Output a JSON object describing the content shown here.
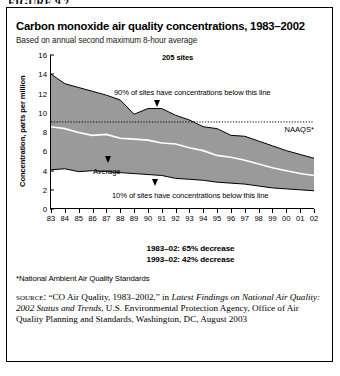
{
  "top_fragment": "FIGURE 9.2",
  "figure": {
    "title": "Carbon monoxide air quality concentrations, 1983–2002",
    "subtitle": "Based on annual second maximum 8-hour average",
    "sites_label": "205 sites",
    "naaqs_label": "NAAQS*",
    "upper_annotation": "90% of sites have concentrations below this line",
    "lower_annotation": "10% of sites have concentrations below this line",
    "average_annotation": "Average",
    "stats": [
      "1983–02: 65% decrease",
      "1993–02: 42% decrease"
    ],
    "footnote": "*National Ambient Air Quality Standards",
    "source_kicker": "source:",
    "source_text_1": "“CO Air Quality, 1983–2002,” in ",
    "source_italic_1": "Latest Findings on National Air Quality: 2002 Status and Trends",
    "source_text_2": ", U.S. Environmental Protection Agency, Office of Air Quality Planning and Standards, Washington, DC, August 2003"
  },
  "chart_data": {
    "type": "area",
    "title": "Carbon monoxide air quality concentrations, 1983–2002",
    "subtitle": "Based on annual second maximum 8-hour average",
    "xlabel": "",
    "ylabel": "Concentration, parts per million",
    "ylim": [
      0,
      16
    ],
    "yticks": [
      0,
      2,
      4,
      6,
      8,
      10,
      12,
      14,
      16
    ],
    "grid": false,
    "legend_position": "inline-annotations",
    "x": [
      "83",
      "84",
      "85",
      "86",
      "87",
      "88",
      "89",
      "90",
      "91",
      "92",
      "93",
      "94",
      "95",
      "96",
      "97",
      "98",
      "99",
      "00",
      "01",
      "02"
    ],
    "x_full_years": [
      1983,
      1984,
      1985,
      1986,
      1987,
      1988,
      1989,
      1990,
      1991,
      1992,
      1993,
      1994,
      1995,
      1996,
      1997,
      1998,
      1999,
      2000,
      2001,
      2002
    ],
    "series": [
      {
        "name": "90th percentile",
        "annotation": "90% of sites have concentrations below this line",
        "values": [
          14.0,
          13.0,
          12.6,
          12.2,
          11.8,
          11.3,
          9.8,
          10.4,
          10.4,
          9.7,
          9.2,
          8.5,
          8.3,
          7.6,
          7.5,
          7.0,
          6.5,
          6.0,
          5.6,
          5.2
        ]
      },
      {
        "name": "Average",
        "annotation": "Average",
        "values": [
          8.5,
          8.3,
          7.9,
          7.6,
          7.7,
          7.3,
          7.2,
          7.1,
          6.8,
          6.7,
          6.3,
          6.0,
          5.5,
          5.3,
          5.0,
          4.6,
          4.2,
          3.9,
          3.6,
          3.4
        ]
      },
      {
        "name": "10th percentile",
        "annotation": "10% of sites have concentrations below this line",
        "values": [
          4.0,
          4.1,
          3.8,
          3.9,
          3.8,
          3.7,
          3.6,
          3.5,
          3.4,
          3.1,
          3.0,
          2.9,
          2.7,
          2.6,
          2.5,
          2.3,
          2.1,
          2.0,
          1.9,
          1.8
        ]
      }
    ],
    "reference_line": {
      "label": "NAAQS*",
      "value": 9
    },
    "annotations": [
      {
        "text": "205 sites",
        "bold": true
      },
      {
        "text": "1983–02: 65% decrease",
        "bold": true
      },
      {
        "text": "1993–02: 42% decrease",
        "bold": true
      }
    ],
    "colors": {
      "band_fill": "#9a9a9a",
      "band_edge": "#000000",
      "average_line": "#ffffff",
      "reference_line": "#000000",
      "axis": "#000000"
    }
  }
}
